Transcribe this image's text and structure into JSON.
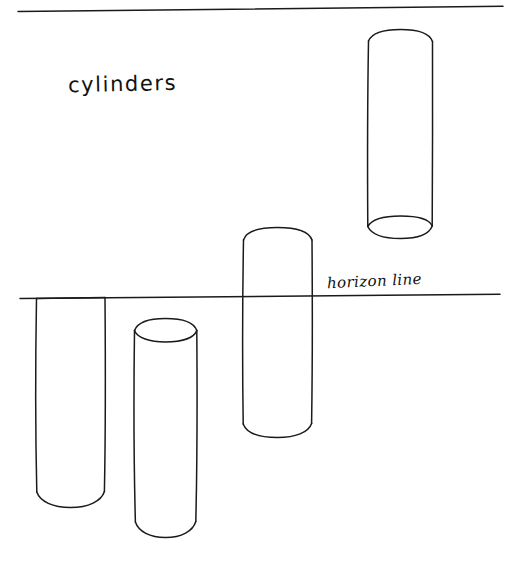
{
  "page": {
    "background_color": "#ffffff",
    "ink_color": "#1a1a1a",
    "width": 520,
    "height": 561,
    "medium": "pen on paper"
  },
  "labels": {
    "title": "cylinders",
    "horizon": "horizon line"
  },
  "lines": {
    "top_rule": {
      "name": "top-border-rule",
      "x1": 18,
      "y1": 11,
      "x2": 503,
      "y2": 6
    },
    "horizon": {
      "name": "horizon-line",
      "x1": 20,
      "y1": 298,
      "x2": 500,
      "y2": 294
    }
  },
  "cylinders": [
    {
      "name": "cylinder-upper-right",
      "position": "above horizon",
      "left": 368,
      "right": 433,
      "top": 31,
      "bottom": 228,
      "top_cap": "convex arc bulging upward (viewed from below, far side hidden)",
      "bottom_cap": "full visible ellipse (viewed from below)",
      "ellipse_ry": 11
    },
    {
      "name": "cylinder-middle-crossing",
      "position": "crossing horizon",
      "left": 243,
      "right": 312,
      "top": 227,
      "bottom": 437,
      "top_cap": "shallow convex arc bulging upward",
      "bottom_cap": "convex arc bulging downward",
      "ellipse_ry": 9
    },
    {
      "name": "cylinder-lower-left",
      "position": "below horizon, top at horizon level",
      "left": 36,
      "right": 105,
      "top": 298,
      "bottom": 508,
      "top_cap": "flat line at horizon (ellipse collapsed to a straight edge)",
      "bottom_cap": "convex arc bulging downward",
      "ellipse_ry": 0
    },
    {
      "name": "cylinder-lower-front",
      "position": "below horizon",
      "left": 134,
      "right": 197,
      "top": 330,
      "bottom": 538,
      "top_cap": "full visible ellipse (viewed from above)",
      "bottom_cap": "convex arc bulging downward",
      "ellipse_ry": 11
    }
  ]
}
